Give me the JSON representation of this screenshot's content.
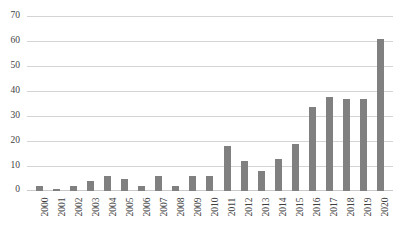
{
  "chart_data": {
    "type": "bar",
    "title": "",
    "subtitle": "",
    "xlabel": "",
    "ylabel": "",
    "ylim": [
      0,
      70
    ],
    "yticks": [
      0,
      10,
      20,
      30,
      40,
      50,
      60,
      70
    ],
    "grid": true,
    "legend": false,
    "legend_position": "none",
    "bar_color": "#808080",
    "gridline_color": "#d4d4d4",
    "categories": [
      "2000",
      "2001",
      "2002",
      "2003",
      "2004",
      "2005",
      "2006",
      "2007",
      "2008",
      "2009",
      "2010",
      "2011",
      "2012",
      "2013",
      "2014",
      "2015",
      "2016",
      "2017",
      "2018",
      "2019",
      "2020"
    ],
    "values": [
      2,
      1,
      2,
      4,
      6,
      5,
      2,
      6,
      2,
      6,
      6,
      18,
      12,
      8,
      13,
      19,
      34,
      38,
      37,
      37,
      61
    ]
  }
}
